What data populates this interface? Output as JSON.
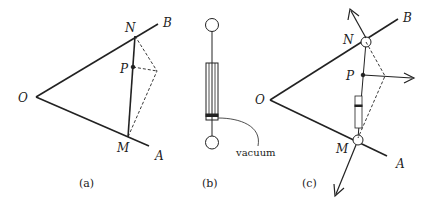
{
  "figure": {
    "panels": [
      {
        "id": "a",
        "caption": "(a)",
        "labels": {
          "O": "O",
          "A": "A",
          "B": "B",
          "N": "N",
          "M": "M",
          "P": "P"
        }
      },
      {
        "id": "b",
        "caption": "(b)",
        "annotation": "vacuum"
      },
      {
        "id": "c",
        "caption": "(c)",
        "labels": {
          "O": "O",
          "A": "A",
          "B": "B",
          "N": "N",
          "M": "M",
          "P": "P"
        }
      }
    ]
  }
}
